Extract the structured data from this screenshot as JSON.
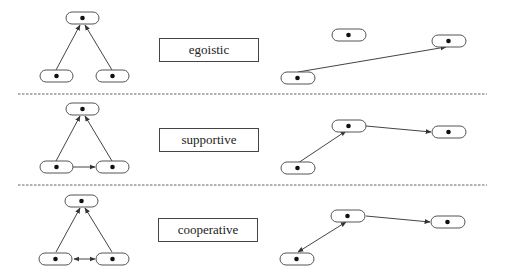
{
  "rows": [
    {
      "label": "egoistic",
      "triangle_edges": "children point to parent only",
      "right_edges": "one long edge to far node; middle node isolated"
    },
    {
      "label": "supportive",
      "triangle_edges": "children point to parent; left child points to right child",
      "right_edges": "chain of directed edges"
    },
    {
      "label": "cooperative",
      "triangle_edges": "children point to parent; bidirectional edge between children",
      "right_edges": "bidirectional edge then directed edge"
    }
  ],
  "colors": {
    "stroke": "#444444",
    "node_fill": "#ffffff",
    "dot": "#111111"
  }
}
